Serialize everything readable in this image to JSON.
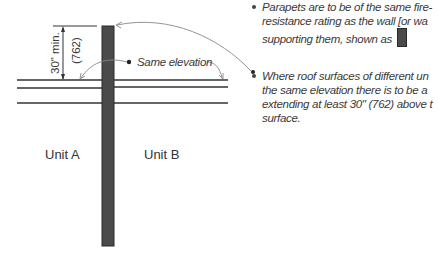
{
  "diagram": {
    "dimension": {
      "imperial": "30\" min.",
      "metric": "(762)"
    },
    "callout": "Same elevation",
    "units": {
      "left": "Unit A",
      "right": "Unit B"
    },
    "colors": {
      "wall_fill": "#4a4a4a",
      "line": "#333333",
      "leader": "#888888"
    }
  },
  "notes": [
    {
      "lines": [
        "Parapets are to be of the same fire-",
        "resistance rating as the wall [or wa",
        "supporting them, shown as"
      ],
      "has_swatch": true
    },
    {
      "lines": [
        "Where roof surfaces of different un",
        "the same elevation there is to be a ",
        "extending at least 30\" (762) above t",
        "surface."
      ],
      "has_swatch": false
    }
  ]
}
